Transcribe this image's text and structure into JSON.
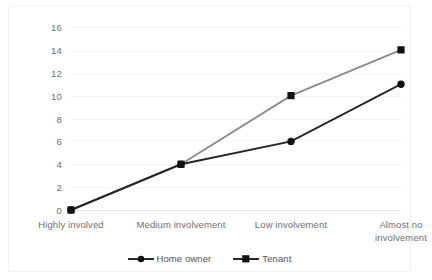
{
  "chart_data": {
    "type": "line",
    "title": "",
    "subtitle": "",
    "xlabel": "",
    "ylabel": "",
    "categories": [
      "Highly involved",
      "Medium involvement",
      "Low involvement",
      "Almost no involvement"
    ],
    "series": [
      {
        "name": "Home owner",
        "values": [
          0,
          4,
          6,
          11
        ],
        "color": "#262626",
        "marker": "circle"
      },
      {
        "name": "Tenant",
        "values": [
          0,
          4,
          10,
          14
        ],
        "color": "#8c8c8c",
        "marker": "square"
      }
    ],
    "ylim": [
      0,
      16
    ],
    "yticks": [
      0,
      2,
      4,
      6,
      8,
      10,
      12,
      14,
      16
    ],
    "ytick_labels": [
      "0",
      "2",
      "4",
      "6",
      "8",
      "10",
      "12",
      "14",
      "16"
    ],
    "grid": true,
    "grid_axis": "y",
    "legend": true,
    "legend_position": "bottom",
    "legend_entries": [
      "Home owner",
      "Tenant"
    ],
    "annotations": []
  },
  "colors": {
    "background": "#ffffff",
    "frame_border": "#f2f2f2",
    "gridline": "#f4f4f4",
    "baseline": "#e6e6e6",
    "tick_text": "#6f6f6f",
    "legend_text": "#555555",
    "home_owner": "#262626",
    "tenant": "#8c8c8c"
  }
}
